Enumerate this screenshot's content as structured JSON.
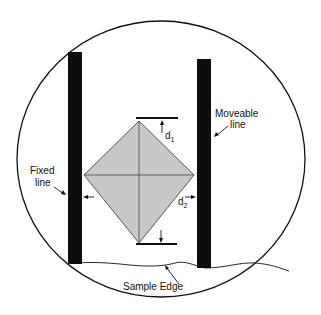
{
  "diagram": {
    "colors": {
      "background": "#ffffff",
      "stroke": "#111111",
      "bar": "#0d0d0d",
      "indent_fill": "#c8c8c8",
      "indent_stroke": "#555555"
    },
    "labels": {
      "fixed_line_1": "Fixed",
      "fixed_line_2": "line",
      "moveable_line_1": "Moveable",
      "moveable_line_2": "line",
      "d1": "d",
      "d1_sub": "1",
      "d2": "d",
      "d2_sub": "2",
      "sample_edge": "Sample Edge"
    }
  }
}
